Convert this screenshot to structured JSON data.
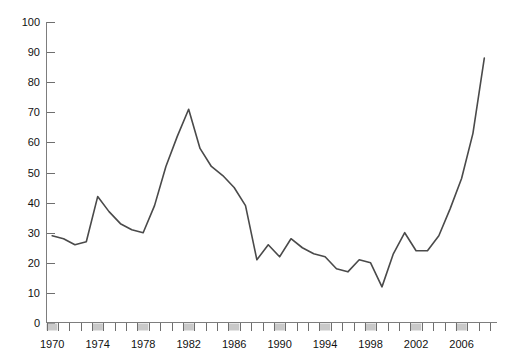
{
  "chart_data": {
    "type": "line",
    "title": "",
    "subtitle": "",
    "xlabel": "",
    "ylabel": "",
    "xlim": [
      1970,
      2009
    ],
    "ylim": [
      0,
      100
    ],
    "grid": false,
    "legend": null,
    "legend_position": "none",
    "line_color": "#4a4a4a",
    "axis_color": "#7d7d7d",
    "tick_block_color": "#c9c9c9",
    "y_ticks": [
      0,
      10,
      20,
      30,
      40,
      50,
      60,
      70,
      80,
      90,
      100
    ],
    "y_tick_labels": [
      "0",
      "10",
      "20",
      "30",
      "40",
      "50",
      "60",
      "70",
      "80",
      "90",
      "100"
    ],
    "x_ticks": [
      1970,
      1971,
      1972,
      1973,
      1974,
      1975,
      1976,
      1977,
      1978,
      1979,
      1980,
      1981,
      1982,
      1983,
      1984,
      1985,
      1986,
      1987,
      1988,
      1989,
      1990,
      1991,
      1992,
      1993,
      1994,
      1995,
      1996,
      1997,
      1998,
      1999,
      2000,
      2001,
      2002,
      2003,
      2004,
      2005,
      2006,
      2007,
      2008,
      2009
    ],
    "x_tick_labels": [
      "1970",
      "1974",
      "1978",
      "1982",
      "1986",
      "1990",
      "1994",
      "1998",
      "2002",
      "2006"
    ],
    "x_labeled_ticks": [
      1970,
      1974,
      1978,
      1982,
      1986,
      1990,
      1994,
      1998,
      2002,
      2006
    ],
    "x_shaded_ticks": [
      1970,
      1974,
      1978,
      1982,
      1986,
      1990,
      1994,
      1998,
      2002,
      2006
    ],
    "x": [
      1970,
      1971,
      1972,
      1973,
      1974,
      1975,
      1976,
      1977,
      1978,
      1979,
      1980,
      1981,
      1982,
      1983,
      1984,
      1985,
      1986,
      1987,
      1988,
      1989,
      1990,
      1991,
      1992,
      1993,
      1994,
      1995,
      1996,
      1997,
      1998,
      1999,
      2000,
      2001,
      2002,
      2003,
      2004,
      2005,
      2006,
      2007,
      2008
    ],
    "values": [
      29,
      28,
      26,
      27,
      42,
      37,
      33,
      31,
      30,
      39,
      52,
      62,
      71,
      58,
      52,
      49,
      45,
      39,
      21,
      26,
      22,
      28,
      25,
      23,
      22,
      18,
      17,
      21,
      20,
      12,
      23,
      30,
      24,
      24,
      29,
      38,
      48,
      63,
      88
    ]
  }
}
